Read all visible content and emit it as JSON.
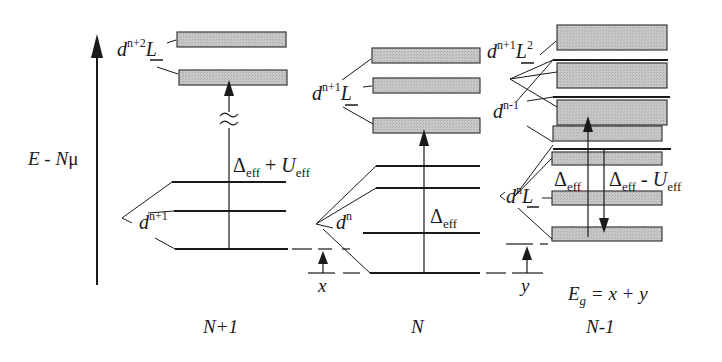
{
  "diagram": {
    "axis_label": {
      "E": "E",
      "minus": " - ",
      "N": "N",
      "mu": "μ"
    },
    "columns": [
      {
        "id": "n_plus_1",
        "label": "N+1"
      },
      {
        "id": "n",
        "label": "N"
      },
      {
        "id": "n_minus_1",
        "label": "N-1"
      }
    ],
    "labels": {
      "np1_upper": {
        "d": "d",
        "sup": "n+2",
        "L": "L"
      },
      "np1_lower": {
        "d": "d",
        "sup": "n+1"
      },
      "n_upper": {
        "d": "d",
        "sup": "n+1",
        "L": "L"
      },
      "n_lower": {
        "d": "d",
        "sup": "n"
      },
      "nm1_L2": {
        "d": "d",
        "sup": "n+1",
        "L": "L",
        "L_sup": "2"
      },
      "nm1_dn1": {
        "d": "d",
        "sup": "n-1"
      },
      "nm1_dnL": {
        "d": "d",
        "sup": "n",
        "L": "L"
      }
    },
    "energies": {
      "delta_eff_plus_u": {
        "delta": "Δ",
        "sub1": "eff",
        "op": " + ",
        "U": "U",
        "sub2": "eff"
      },
      "delta_eff": {
        "delta": "Δ",
        "sub": "eff"
      },
      "delta_eff_nm1": {
        "delta": "Δ",
        "sub": "eff"
      },
      "delta_eff_minus_u": {
        "delta": "Δ",
        "sub1": "eff",
        "op": " - ",
        "U": "U",
        "sub2": "eff"
      }
    },
    "gap": {
      "x": "x",
      "y": "y",
      "Eg_E": "E",
      "Eg_sub": "g",
      "Eg_rhs": " = x + y"
    },
    "colors": {
      "ink": "#1a1a1a",
      "band_fill": "#c4c4c4",
      "band_stroke": "#3a3a3a"
    }
  }
}
